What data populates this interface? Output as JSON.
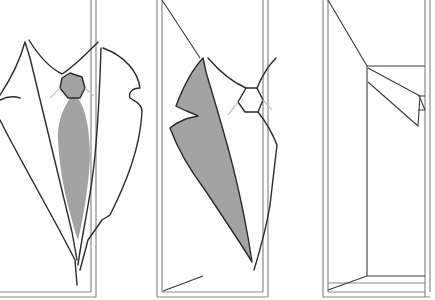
{
  "figure": {
    "panels": [
      {
        "id": "panel-1",
        "subject": "jacket-front-with-tie",
        "x": [
          0,
          96
        ]
      },
      {
        "id": "panel-2",
        "subject": "lapel-folded-over",
        "x": [
          157,
          268
        ]
      },
      {
        "id": "panel-3",
        "subject": "empty-frame-with-fold",
        "x": [
          323,
          420
        ]
      }
    ],
    "colors": {
      "frame": "#8a8a8a",
      "ink": "#2b2b2b",
      "fill": "#a3a3a3",
      "ghost": "#c8c8c8",
      "background": "#ffffff"
    }
  }
}
